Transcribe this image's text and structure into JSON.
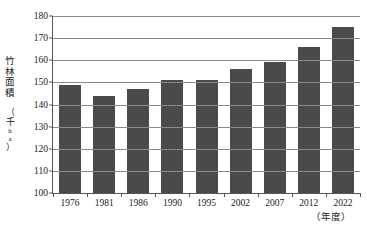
{
  "chart_data": {
    "type": "bar",
    "title": "",
    "xlabel": "(年度)",
    "ylabel": "竹林面積（千ha）",
    "categories": [
      "1976",
      "1981",
      "1986",
      "1990",
      "1995",
      "2002",
      "2007",
      "2012",
      "2022"
    ],
    "values": [
      149,
      144,
      147,
      151,
      151,
      156,
      159,
      166,
      175
    ],
    "ylim": [
      100,
      180
    ],
    "yticks": [
      100,
      110,
      120,
      130,
      140,
      150,
      160,
      170,
      180
    ],
    "ytick_labels": [
      "100",
      "110",
      "120",
      "130",
      "140",
      "150",
      "160",
      "170",
      "180"
    ],
    "grid": true,
    "legend": false,
    "bar_color": "#4a4a4a",
    "axis_color": "#555555",
    "grid_color": "#8a8a8a"
  },
  "axis": {
    "y_caption_chars": [
      "竹",
      "林",
      "面",
      "積"
    ],
    "y_unit_chars": [
      "（",
      "千",
      "h",
      "a",
      "）"
    ],
    "x_unit": "（年度）"
  }
}
